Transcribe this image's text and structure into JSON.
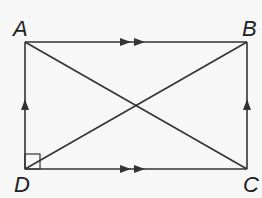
{
  "figure": {
    "type": "rectangle with diagonals",
    "vertices": {
      "A": {
        "label": "A",
        "x": 25,
        "y": 42
      },
      "B": {
        "label": "B",
        "x": 247,
        "y": 42
      },
      "C": {
        "label": "C",
        "x": 247,
        "y": 169
      },
      "D": {
        "label": "D",
        "x": 25,
        "y": 169
      }
    },
    "sides": [
      "AB",
      "BC",
      "CD",
      "DA"
    ],
    "diagonals": [
      "AC",
      "BD"
    ],
    "markings": {
      "AB": "double-arrow",
      "DC": "double-arrow",
      "DA": "single-arrow",
      "CB": "single-arrow",
      "D": "right-angle"
    },
    "stroke_color": "#333333"
  }
}
